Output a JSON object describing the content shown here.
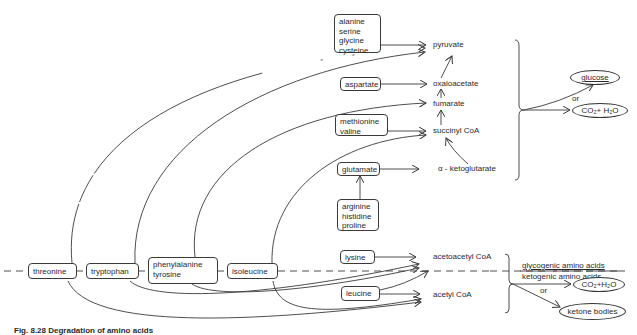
{
  "figure": {
    "caption": "Fig. 8.28  Degradation of amino acids",
    "divider": {
      "upper_label": "glycogenic amino acids",
      "lower_label": "ketogenic amino acids"
    }
  },
  "glucogenic_sources": {
    "box1": [
      "alanine",
      "serine",
      "glycine",
      "cysteine"
    ],
    "box2": [
      "aspartate"
    ],
    "box3": [
      "methionine",
      "valine"
    ],
    "box4": [
      "glutamate"
    ],
    "box5": [
      "arginine",
      "histidine",
      "proline"
    ]
  },
  "mixed_sources": {
    "threonine": "threonine",
    "tryptophan": "tryptophan",
    "phe_tyr": [
      "phenylalanine",
      "tyrosine"
    ],
    "isoleucine": "isoleucine"
  },
  "ketogenic_sources": {
    "lysine": "lysine",
    "leucine": "leucine"
  },
  "intermediates": {
    "pyruvate": "pyruvate",
    "oxaloacetate": "oxaloacetate",
    "fumarate": "fumarate",
    "succinyl_coa": "succinyl CoA",
    "a_ketoglutarate": "α - ketoglutarate",
    "acetoacetyl_coa": "acetoacetyl CoA",
    "acetyl_coa": "acetyl CoA"
  },
  "products": {
    "glucose": "glucose",
    "or1": "or",
    "co2_h2o_top": "CO₂+ H₂O",
    "or2": "or",
    "co2_h2o_bottom": "CO₂+H₂O",
    "ketone_bodies": "ketone bodies"
  },
  "colors": {
    "line": "#3a3a3a",
    "background": "#ffffff"
  }
}
